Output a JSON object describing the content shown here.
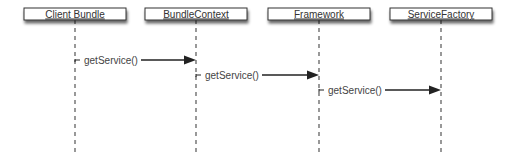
{
  "diagram": {
    "type": "sequence",
    "participants": [
      {
        "id": "client-bundle",
        "label": "Client Bundle"
      },
      {
        "id": "bundle-context",
        "label": "BundleContext"
      },
      {
        "id": "framework",
        "label": "Framework"
      },
      {
        "id": "service-factory",
        "label": "ServiceFactory"
      }
    ],
    "messages": [
      {
        "from": "client-bundle",
        "to": "bundle-context",
        "label": "getService()"
      },
      {
        "from": "bundle-context",
        "to": "framework",
        "label": "getService()"
      },
      {
        "from": "framework",
        "to": "service-factory",
        "label": "getService()"
      }
    ],
    "colors": {
      "line": "#222222",
      "lifeline": "#555555",
      "box_fill": "#ffffff",
      "box_stroke": "#333333",
      "shadow": "#888888"
    }
  }
}
